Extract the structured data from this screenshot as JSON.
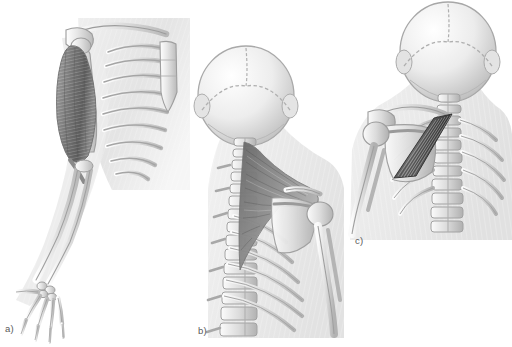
{
  "figure": {
    "style": "grayscale medical illustration",
    "background_color": "#ffffff",
    "label_color": "#595959",
    "panel_count": 3
  },
  "palette": {
    "background": "#ffffff",
    "body_silhouette": "#ebebeb",
    "body_silhouette_edge": "#d8d8d8",
    "bone_light": "#f2f2f2",
    "bone_mid": "#d2d2d2",
    "bone_shadow": "#a8a8a8",
    "bone_outline": "#9a9a9a",
    "muscle_light": "#b4b4b4",
    "muscle_mid": "#8c8c8c",
    "muscle_dark": "#5e5e5e",
    "muscle_darkest": "#3f3f3f",
    "label_text": "#595959"
  },
  "panels": [
    {
      "id": "a",
      "label": "a)",
      "view": "anterior right arm and shoulder",
      "highlighted_muscle": "biceps brachii",
      "structures": [
        "clavicle",
        "scapula",
        "humerus",
        "rib cage",
        "sternum",
        "radius",
        "ulna",
        "carpal bones",
        "metacarpals",
        "phalanges"
      ]
    },
    {
      "id": "b",
      "label": "b)",
      "view": "posterior neck, upper back and shoulder",
      "highlighted_muscle": "trapezius",
      "structures": [
        "cranium",
        "occipital bone",
        "lambdoid suture",
        "cervical vertebrae",
        "thoracic vertebrae",
        "lumbar vertebrae",
        "ribs",
        "scapula",
        "spine of scapula",
        "humerus"
      ]
    },
    {
      "id": "c",
      "label": "c)",
      "view": "posterior upper back and shoulder",
      "highlighted_muscle": "rhomboid major and minor",
      "structures": [
        "cranium",
        "cervical vertebrae",
        "thoracic vertebrae",
        "ribs",
        "scapula",
        "humerus",
        "clavicle"
      ]
    }
  ]
}
